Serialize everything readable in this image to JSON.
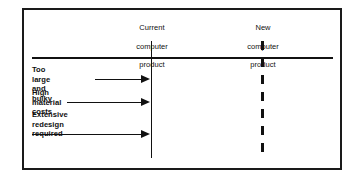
{
  "diagram": {
    "type": "timeline-comparison-diagram",
    "frame": {
      "border_color": "#1a1a1a",
      "background_color": "#ffffff"
    },
    "axis_markers": [
      {
        "id": "current-product",
        "line_style": "solid",
        "line_color": "#111111",
        "label_lines": [
          "Current",
          "computer",
          "product"
        ],
        "label_text": "Current\ncomputer\nproduct"
      },
      {
        "id": "new-product",
        "line_style": "dashed",
        "line_color": "#111111",
        "label_lines": [
          "New",
          "computer",
          "product"
        ],
        "label_text": "New\ncomputer\nproduct"
      }
    ],
    "baseline": {
      "color": "#111111",
      "style": "solid horizontal rule"
    },
    "issue_arrows": [
      {
        "id": "too-large-and-bulky",
        "label": "Too large and bulky",
        "arrow_direction": "right",
        "points_to": "current-product"
      },
      {
        "id": "high-material-costs",
        "label": "High material costs",
        "arrow_direction": "right",
        "points_to": "current-product"
      },
      {
        "id": "extensive-redesign-required",
        "label": "Extensive redesign\nrequired",
        "label_lines": [
          "Extensive redesign",
          "required"
        ],
        "arrow_direction": "right",
        "points_to": "current-product"
      }
    ],
    "colors": {
      "ink": "#111111",
      "frame": "#1a1a1a",
      "paper": "#ffffff"
    }
  }
}
